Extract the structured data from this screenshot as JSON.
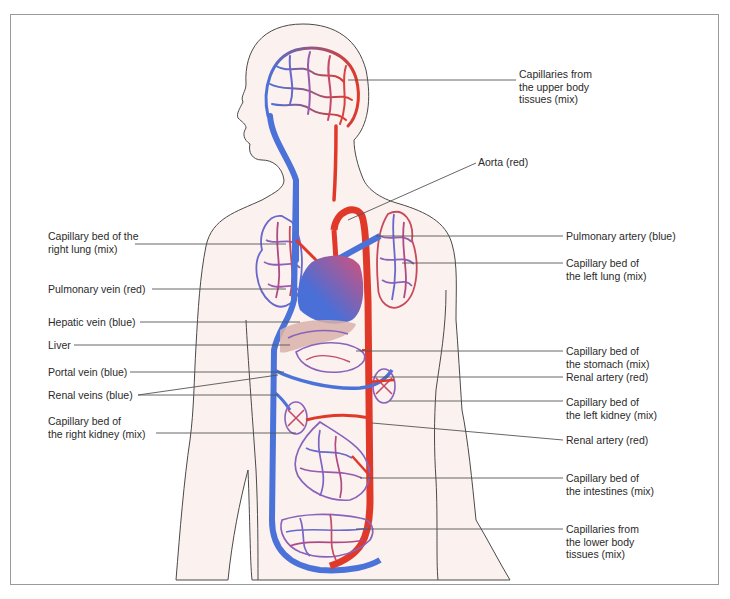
{
  "diagram": {
    "colors": {
      "oxygenated_red": "#e0392a",
      "deoxygenated_blue": "#4a72d8",
      "mixed_purple": "#9a5fb5",
      "skin": "#fbf1ee",
      "liver": "#d9b2aa",
      "outline": "#4a4a4a",
      "leader_line": "#555555",
      "frame": "#9a9a9a"
    },
    "labels_left": [
      {
        "id": "capillary-bed-right-lung",
        "lines": [
          "Capillary bed of the",
          "right lung (mix)"
        ]
      },
      {
        "id": "pulmonary-vein",
        "lines": [
          "Pulmonary vein (red)"
        ]
      },
      {
        "id": "hepatic-vein",
        "lines": [
          "Hepatic vein (blue)"
        ]
      },
      {
        "id": "liver",
        "lines": [
          "Liver"
        ]
      },
      {
        "id": "portal-vein",
        "lines": [
          "Portal vein (blue)"
        ]
      },
      {
        "id": "renal-veins",
        "lines": [
          "Renal veins (blue)"
        ]
      },
      {
        "id": "capillary-bed-right-kidney",
        "lines": [
          "Capillary bed of",
          "the right kidney (mix)"
        ]
      }
    ],
    "labels_right": [
      {
        "id": "capillaries-upper-body",
        "lines": [
          "Capillaries from",
          "the upper body",
          "tissues (mix)"
        ]
      },
      {
        "id": "aorta",
        "lines": [
          "Aorta (red)"
        ]
      },
      {
        "id": "pulmonary-artery",
        "lines": [
          "Pulmonary artery (blue)"
        ]
      },
      {
        "id": "capillary-bed-left-lung",
        "lines": [
          "Capillary bed of",
          "the left lung (mix)"
        ]
      },
      {
        "id": "capillary-bed-stomach",
        "lines": [
          "Capillary bed of",
          "the stomach (mix)"
        ]
      },
      {
        "id": "renal-artery-1",
        "lines": [
          "Renal artery (red)"
        ]
      },
      {
        "id": "capillary-bed-left-kidney",
        "lines": [
          "Capillary bed of",
          "the left kidney (mix)"
        ]
      },
      {
        "id": "renal-artery-2",
        "lines": [
          "Renal artery (red)"
        ]
      },
      {
        "id": "capillary-bed-intestines",
        "lines": [
          "Capillary bed of",
          "the intestines (mix)"
        ]
      },
      {
        "id": "capillaries-lower-body",
        "lines": [
          "Capillaries from",
          "the lower body",
          "tissues (mix)"
        ]
      }
    ]
  }
}
